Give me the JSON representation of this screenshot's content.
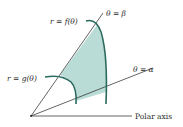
{
  "diagram": {
    "labels": {
      "outer_curve": "r = f(θ)",
      "inner_curve": "r = g(θ)",
      "ray_beta": "θ = β",
      "ray_alpha": "θ = α",
      "axis": "Polar axis"
    },
    "colors": {
      "curve": "#2a6b5e",
      "shade": "#b9dcd6",
      "line": "#222222",
      "background": "#ffffff"
    },
    "nodes": [
      {
        "id": "origin",
        "label": "",
        "x": 31,
        "y": 116
      },
      {
        "id": "ray_beta_end",
        "label": "θ = β",
        "x": 103,
        "y": 13
      },
      {
        "id": "ray_alpha_end",
        "label": "θ = α",
        "x": 153,
        "y": 67
      },
      {
        "id": "axis_end",
        "label": "Polar axis",
        "x": 132,
        "y": 116
      }
    ],
    "edges": [
      {
        "from": "origin",
        "to": "ray_beta_end",
        "label": "θ = β"
      },
      {
        "from": "origin",
        "to": "ray_alpha_end",
        "label": "θ = α"
      },
      {
        "from": "origin",
        "to": "axis_end",
        "label": "Polar axis"
      }
    ]
  }
}
